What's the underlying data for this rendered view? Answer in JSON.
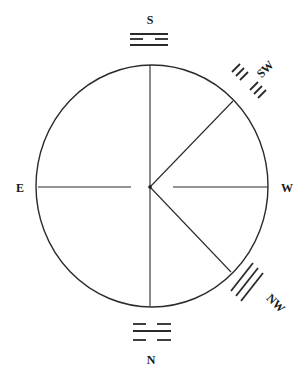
{
  "diagram": {
    "title": "",
    "type": "compass-trigram-diagram",
    "colors": {
      "line": "#2a2a2a",
      "text": "#1a1a1a",
      "background": "#ffffff"
    },
    "circle": {
      "cx": 152,
      "cy": 186,
      "rx": 116,
      "ry": 121
    },
    "directions": [
      {
        "id": "south",
        "label": "S",
        "position": "top"
      },
      {
        "id": "southwest",
        "label": "SW",
        "position": "top-right"
      },
      {
        "id": "west",
        "label": "W",
        "position": "right"
      },
      {
        "id": "northwest",
        "label": "NW",
        "position": "bottom-right"
      },
      {
        "id": "north",
        "label": "N",
        "position": "bottom"
      },
      {
        "id": "east",
        "label": "E",
        "position": "left"
      }
    ],
    "trigrams": [
      {
        "direction": "S",
        "lines_top_to_bottom": [
          "solid",
          "broken",
          "solid"
        ],
        "name": "Li"
      },
      {
        "direction": "SW",
        "lines_inner_to_outer": [
          "broken",
          "broken",
          "broken"
        ],
        "name": "K'un"
      },
      {
        "direction": "NW",
        "lines_inner_to_outer": [
          "solid",
          "solid",
          "solid"
        ],
        "name": "Ch'ien"
      },
      {
        "direction": "N",
        "lines_top_to_bottom": [
          "broken",
          "solid",
          "broken"
        ],
        "name": "K'an"
      }
    ],
    "radii": [
      {
        "to": "S",
        "from": [
          150,
          187
        ],
        "end": [
          150,
          65
        ]
      },
      {
        "to": "N",
        "from": [
          150,
          187
        ],
        "end": [
          150,
          306
        ]
      },
      {
        "to": "SW",
        "from": [
          150,
          187
        ],
        "end": [
          233,
          101
        ]
      },
      {
        "to": "NW",
        "from": [
          150,
          187
        ],
        "end": [
          231,
          272
        ]
      },
      {
        "to": "E",
        "from": [
          131,
          187
        ],
        "end": [
          38,
          187
        ],
        "segment": "outer"
      },
      {
        "to": "W",
        "from": [
          173,
          187
        ],
        "end": [
          268,
          187
        ],
        "segment": "outer"
      }
    ]
  }
}
